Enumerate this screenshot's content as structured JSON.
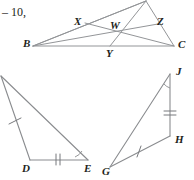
{
  "figure": {
    "caption_fragment": "– 10,",
    "background_color": "#ffffff",
    "line_color": "#939598",
    "label_color": "#231f20"
  },
  "diagram_top": {
    "name": "triangle-abc-with-cevians",
    "vertices": [
      {
        "id": "A",
        "label": "",
        "x": 146,
        "y": 1
      },
      {
        "id": "B",
        "label": "B",
        "x": 33,
        "y": 46
      },
      {
        "id": "C",
        "label": "C",
        "x": 174,
        "y": 46
      }
    ],
    "points": [
      {
        "id": "X",
        "label": "X",
        "x": 85,
        "y": 23
      },
      {
        "id": "Z",
        "label": "Z",
        "x": 158,
        "y": 24
      },
      {
        "id": "Y",
        "label": "Y",
        "x": 110,
        "y": 46
      },
      {
        "id": "W",
        "label": "W",
        "x": 116,
        "y": 28
      }
    ],
    "labels": {
      "B": "B",
      "C": "C",
      "X": "X",
      "Y": "Y",
      "Z": "Z",
      "W": "W"
    }
  },
  "diagram_left": {
    "name": "triangle-def",
    "vertices": [
      {
        "id": "F",
        "label": "",
        "x": 1,
        "y": 76
      },
      {
        "id": "D",
        "label": "D",
        "x": 30,
        "y": 160
      },
      {
        "id": "E",
        "label": "E",
        "x": 88,
        "y": 160
      }
    ],
    "labels": {
      "D": "D",
      "E": "E"
    },
    "marks": {
      "single_tick_side": "DF",
      "double_tick_side": "DE",
      "angle_arc_vertex": "E"
    }
  },
  "diagram_right": {
    "name": "triangle-ghj",
    "vertices": [
      {
        "id": "J",
        "label": "J",
        "x": 170,
        "y": 74
      },
      {
        "id": "H",
        "label": "H",
        "x": 170,
        "y": 136
      },
      {
        "id": "G",
        "label": "G",
        "x": 110,
        "y": 167
      }
    ],
    "labels": {
      "J": "J",
      "H": "H",
      "G": "G"
    },
    "marks": {
      "single_tick_side": "GH",
      "double_tick_side": "JH",
      "angle_arc_vertex": "J"
    }
  }
}
